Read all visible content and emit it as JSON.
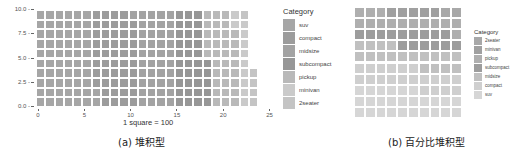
{
  "chart_data": [
    {
      "type": "waffle",
      "subtype": "stacked",
      "title": "",
      "caption": "(a) 堆积型",
      "xlabel": "1 square = 100",
      "ylabel": "",
      "xlim": [
        0,
        25
      ],
      "ylim": [
        0,
        10
      ],
      "x_ticks": [
        "0",
        "5",
        "10",
        "15",
        "20",
        "25"
      ],
      "y_ticks": [
        "0.0",
        "2.5",
        "5.0",
        "7.5",
        "10.0"
      ],
      "grid": false,
      "legend_position": "right",
      "legend_title": "Category",
      "categories": [
        "suv",
        "compact",
        "midsize",
        "subcompact",
        "pickup",
        "minivan",
        "2seater"
      ],
      "values": [
        62,
        47,
        41,
        35,
        33,
        11,
        5
      ],
      "colors": [
        "#a6a6a6",
        "#9c9c9c",
        "#a3a3a3",
        "#979797",
        "#b9b9b9",
        "#cacaca",
        "#c4c4c4"
      ],
      "rows": 10
    },
    {
      "type": "waffle",
      "subtype": "percent_stacked",
      "title": "",
      "caption": "(b) 百分比堆积型",
      "xlabel": "",
      "ylabel": "",
      "grid": false,
      "legend_position": "right",
      "legend_title": "Category",
      "categories": [
        "2seater",
        "minivan",
        "pickup",
        "subcompact",
        "midsize",
        "compact",
        "suv"
      ],
      "values": [
        2,
        5,
        14,
        15,
        18,
        20,
        26
      ],
      "colors": [
        "#a8a8a8",
        "#a0a0a0",
        "#afafaf",
        "#9d9d9d",
        "#c0c0c0",
        "#cfcfcf",
        "#d6d6d6"
      ],
      "rows": 10,
      "cols": 10
    }
  ]
}
